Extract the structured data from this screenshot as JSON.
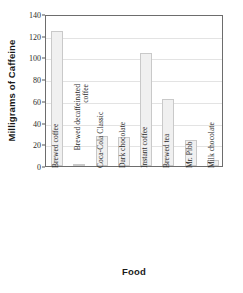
{
  "chart_data": {
    "type": "bar",
    "title": "",
    "xlabel": "Food",
    "ylabel": "Milligrams of Caffeine",
    "categories": [
      "Brewed coffee",
      "Brewed decaffeinated coffee",
      "Coca-Cola Classic",
      "Dark chocolate",
      "Instant coffee",
      "Brewed tea",
      "Mr. Pibb",
      "Milk chocolate"
    ],
    "values": [
      124,
      2,
      28,
      27,
      104,
      62,
      24,
      6
    ],
    "ylim": [
      0,
      140
    ],
    "yticks": [
      0,
      20,
      40,
      60,
      80,
      100,
      120,
      140
    ],
    "ytick_labels": [
      "0",
      "20",
      "40",
      "60",
      "80",
      "100",
      "120",
      "140"
    ],
    "grid": true,
    "grid_axis": "y",
    "legend": false,
    "bar_fill_color": "#f0f0f0",
    "bar_border_color": "#c9c9c9",
    "axis_color": "#6d6d6d",
    "grid_color": "#e3e3e3",
    "text_color": "#2b2b2b"
  }
}
